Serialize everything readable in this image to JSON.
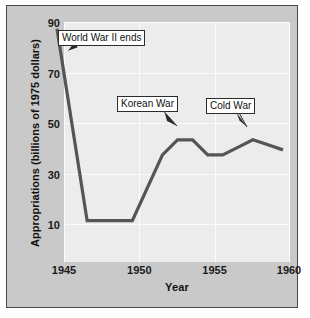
{
  "chart_data": {
    "type": "line",
    "title": "",
    "xlabel": "Year",
    "ylabel": "Appropriations (billions of 1975 dollars)",
    "xlim": [
      1945,
      1960
    ],
    "ylim": [
      0,
      95
    ],
    "xticks": [
      1945,
      1950,
      1955,
      1960
    ],
    "yticks": [
      10,
      30,
      50,
      70,
      90
    ],
    "grid": true,
    "legend": "none",
    "line_color": "#555555",
    "x": [
      1945,
      1946,
      1947,
      1948,
      1949,
      1950,
      1951,
      1952,
      1953,
      1954,
      1955,
      1956,
      1957,
      1958,
      1959,
      1960
    ],
    "values": [
      90,
      52,
      14,
      14,
      14,
      14,
      27,
      40,
      46,
      46,
      40,
      40,
      43,
      46,
      44,
      42
    ],
    "series": [
      {
        "name": "Appropriations",
        "values": [
          90,
          52,
          14,
          14,
          14,
          14,
          27,
          40,
          46,
          46,
          40,
          40,
          43,
          46,
          44,
          42
        ]
      }
    ],
    "annotations": [
      {
        "label": "World War II ends",
        "target_x": 1945.6,
        "target_y": 72
      },
      {
        "label": "Korean War",
        "target_x": 1952.9,
        "target_y": 46
      },
      {
        "label": "Cold War",
        "target_x": 1958.0,
        "target_y": 46
      }
    ]
  },
  "axis": {
    "y_tick_labels": [
      "90",
      "70",
      "50",
      "30",
      "10"
    ],
    "x_tick_labels": [
      "1945",
      "1950",
      "1955",
      "1960"
    ],
    "x_title": "Year",
    "y_title": "Appropriations (billions of 1975 dollars)"
  },
  "annotations": {
    "ww2": "World War II ends",
    "korea": "Korean War",
    "cold": "Cold War"
  },
  "colors": {
    "panel_bg": "#c9c9c9",
    "plot_bg": "#ececec",
    "grid": "#fbfbfb",
    "line": "#555555",
    "border": "#4a4a4a",
    "text": "#111111"
  }
}
